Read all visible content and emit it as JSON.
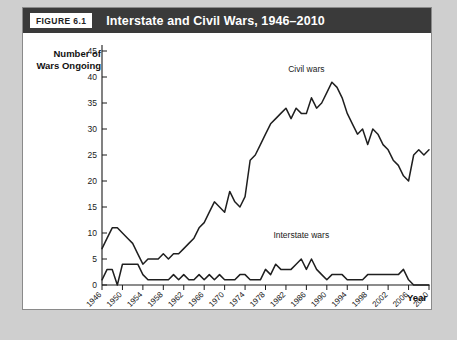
{
  "figure": {
    "tag": "FIGURE 6.1",
    "title": "Interstate and Civil Wars, 1946–2010"
  },
  "chart_data": {
    "type": "line",
    "title": "Interstate and Civil Wars, 1946–2010",
    "xlabel": "Year",
    "ylabel": "Number of Wars Ongoing",
    "ylabel_lines": [
      "Number of",
      "Wars Ongoing"
    ],
    "xlim": [
      1946,
      2010
    ],
    "ylim": [
      0,
      45
    ],
    "yticks": [
      0,
      5,
      10,
      15,
      20,
      25,
      30,
      35,
      40,
      45
    ],
    "xticks": [
      1946,
      1950,
      1954,
      1958,
      1962,
      1966,
      1970,
      1974,
      1978,
      1982,
      1986,
      1990,
      1994,
      1998,
      2002,
      2006,
      2010
    ],
    "xtick_rotation": 45,
    "grid": false,
    "legend": "inline-annotations",
    "annotations": [
      {
        "text": "Civil wars",
        "x": 1986,
        "y": 41
      },
      {
        "text": "Interstate wars",
        "x": 1985,
        "y": 9
      }
    ],
    "x": [
      1946,
      1947,
      1948,
      1949,
      1950,
      1951,
      1952,
      1953,
      1954,
      1955,
      1956,
      1957,
      1958,
      1959,
      1960,
      1961,
      1962,
      1963,
      1964,
      1965,
      1966,
      1967,
      1968,
      1969,
      1970,
      1971,
      1972,
      1973,
      1974,
      1975,
      1976,
      1977,
      1978,
      1979,
      1980,
      1981,
      1982,
      1983,
      1984,
      1985,
      1986,
      1987,
      1988,
      1989,
      1990,
      1991,
      1992,
      1993,
      1994,
      1995,
      1996,
      1997,
      1998,
      1999,
      2000,
      2001,
      2002,
      2003,
      2004,
      2005,
      2006,
      2007,
      2008,
      2009,
      2010
    ],
    "series": [
      {
        "name": "Civil wars",
        "values": [
          7,
          9,
          11,
          11,
          10,
          9,
          8,
          6,
          4,
          5,
          5,
          5,
          6,
          5,
          6,
          6,
          7,
          8,
          9,
          11,
          12,
          14,
          16,
          15,
          14,
          18,
          16,
          15,
          17,
          24,
          25,
          27,
          29,
          31,
          32,
          33,
          34,
          32,
          34,
          33,
          33,
          36,
          34,
          35,
          37,
          39,
          38,
          36,
          33,
          31,
          29,
          30,
          27,
          30,
          29,
          27,
          26,
          24,
          23,
          21,
          20,
          25,
          26,
          25,
          26
        ]
      },
      {
        "name": "Interstate wars",
        "values": [
          1,
          3,
          3,
          0,
          4,
          4,
          4,
          4,
          2,
          1,
          1,
          1,
          1,
          1,
          2,
          1,
          2,
          1,
          1,
          2,
          1,
          2,
          1,
          2,
          1,
          1,
          1,
          2,
          2,
          1,
          1,
          1,
          3,
          2,
          4,
          3,
          3,
          3,
          4,
          5,
          3,
          5,
          3,
          2,
          1,
          2,
          2,
          2,
          1,
          1,
          1,
          1,
          2,
          2,
          2,
          2,
          2,
          2,
          2,
          3,
          1,
          0,
          0,
          0,
          0
        ]
      }
    ]
  }
}
